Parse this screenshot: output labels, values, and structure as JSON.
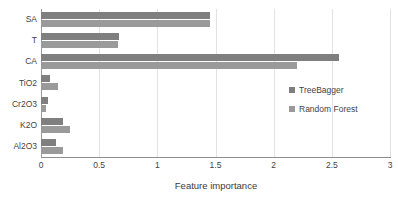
{
  "chart_data": {
    "type": "bar",
    "orientation": "horizontal",
    "title": "",
    "xlabel": "Feature importance",
    "ylabel": "",
    "xlim": [
      0,
      3
    ],
    "ylim": null,
    "grid": true,
    "grid_axis": "x",
    "legend_position": "center-right",
    "categories": [
      "SA",
      "T",
      "CA",
      "TiO2",
      "Cr2O3",
      "K2O",
      "Al2O3"
    ],
    "xticks": [
      "0",
      "0.5",
      "1",
      "1.5",
      "2",
      "2.5",
      "3"
    ],
    "xtick_values": [
      0,
      0.5,
      1,
      1.5,
      2,
      2.5,
      3
    ],
    "series": [
      {
        "name": "TreeBagger",
        "color": "#7f7f7f",
        "values": [
          1.45,
          0.67,
          2.56,
          0.08,
          0.06,
          0.19,
          0.13
        ]
      },
      {
        "name": "Random Forest",
        "color": "#9a9a9a",
        "values": [
          1.45,
          0.66,
          2.2,
          0.15,
          0.04,
          0.25,
          0.19
        ]
      }
    ]
  },
  "axis": {
    "x_title": "Feature importance"
  },
  "legend": {
    "entries": [
      {
        "label": "TreeBagger",
        "color": "#7f7f7f"
      },
      {
        "label": "Random Forest",
        "color": "#9a9a9a"
      }
    ]
  },
  "colors": {
    "series_treebagger": "#7f7f7f",
    "series_random_forest": "#9a9a9a",
    "gridline": "#e2e2e2",
    "axis": "#8f8f8f",
    "text": "#3f3f3f",
    "background": "#ffffff"
  },
  "caption_artifact": ""
}
